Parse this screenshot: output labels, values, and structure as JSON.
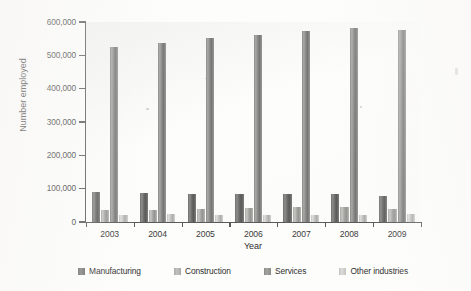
{
  "chart_data": {
    "type": "bar",
    "title": "",
    "xlabel": "Year",
    "ylabel": "Number employed",
    "categories": [
      "2003",
      "2004",
      "2005",
      "2006",
      "2007",
      "2008",
      "2009"
    ],
    "ylim": [
      0,
      600000
    ],
    "ytick_labels": [
      "0",
      "100,000",
      "200,000",
      "300,000",
      "400,000",
      "500,000",
      "600,000"
    ],
    "ytick_values": [
      0,
      100000,
      200000,
      300000,
      400000,
      500000,
      600000
    ],
    "grid": false,
    "legend_position": "bottom",
    "series": [
      {
        "name": "Manufacturing",
        "color": "#6e6e6c",
        "values": [
          90000,
          88000,
          85000,
          85000,
          85000,
          83000,
          78000
        ]
      },
      {
        "name": "Construction",
        "color": "#a8a8a4",
        "values": [
          36000,
          37000,
          39000,
          43000,
          45000,
          45000,
          38000
        ]
      },
      {
        "name": "Services",
        "color": "#8a8a87",
        "values": [
          525000,
          538000,
          553000,
          562000,
          574000,
          582000,
          575000
        ]
      },
      {
        "name": "Other industries",
        "color": "#c2c2be",
        "values": [
          22000,
          23000,
          22000,
          21000,
          22000,
          22000,
          23000
        ]
      }
    ]
  },
  "legend": {
    "items": [
      {
        "label": "Manufacturing",
        "color": "#6e6e6c"
      },
      {
        "label": "Construction",
        "color": "#a8a8a4"
      },
      {
        "label": "Services",
        "color": "#8a8a87"
      },
      {
        "label": "Other industries",
        "color": "#c2c2be"
      }
    ]
  },
  "axes": {
    "y_title": "Number employed",
    "x_title": "Year"
  }
}
